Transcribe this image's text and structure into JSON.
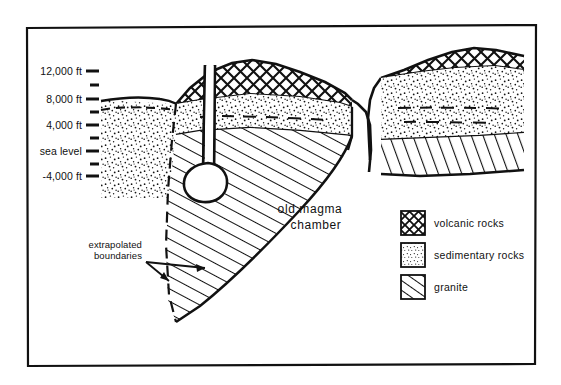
{
  "figure": {
    "kind": "geologic-cross-section",
    "background_color": "#ffffff",
    "ink_color": "#111111",
    "border": {
      "x": 26,
      "y": 25,
      "width": 510,
      "height": 340
    }
  },
  "axis": {
    "title": "",
    "major_ticks": [
      {
        "label": "12,000 ft",
        "y": 71
      },
      {
        "label": "8,000 ft",
        "y": 99
      },
      {
        "label": "4,000 ft",
        "y": 125
      },
      {
        "label": "sea level",
        "y": 151
      },
      {
        "label": "-4,000 ft",
        "y": 176
      }
    ],
    "minor_ticks_y": [
      85,
      112,
      138,
      164
    ],
    "tick_x_start": 86,
    "tick_x_end": 99,
    "minor_tick_x_start": 90,
    "minor_tick_x_end": 99
  },
  "annotations": {
    "magma_chamber": {
      "line1": "old magma",
      "line2": "chamber",
      "x": 310,
      "y": 213
    },
    "extrapolated": {
      "line1": "extrapolated",
      "line2": "boundaries",
      "x": 138,
      "y": 245
    }
  },
  "legend": {
    "box": {
      "x": 396,
      "y": 206,
      "width": 140,
      "height": 92
    },
    "items": [
      {
        "label": "volcanic rocks",
        "pattern": "cross-hatch",
        "swatch_y": 211
      },
      {
        "label": "sedimentary rocks",
        "pattern": "stipple",
        "swatch_y": 243
      },
      {
        "label": "granite",
        "pattern": "diagonal-lines",
        "swatch_y": 275
      }
    ],
    "swatch_x": 401,
    "swatch_size": 24,
    "text_x": 434
  },
  "units": [
    {
      "name": "volcanic-cap-main",
      "rock": "volcanic rocks"
    },
    {
      "name": "volcanic-cap-right",
      "rock": "volcanic rocks"
    },
    {
      "name": "sedimentary-left",
      "rock": "sedimentary rocks"
    },
    {
      "name": "sedimentary-main",
      "rock": "sedimentary rocks"
    },
    {
      "name": "sedimentary-right",
      "rock": "sedimentary rocks"
    },
    {
      "name": "granite-pluton",
      "rock": "granite"
    },
    {
      "name": "granite-right-block",
      "rock": "granite"
    },
    {
      "name": "magma-conduit",
      "rock": "conduit"
    },
    {
      "name": "magma-blob",
      "rock": "chamber"
    }
  ]
}
